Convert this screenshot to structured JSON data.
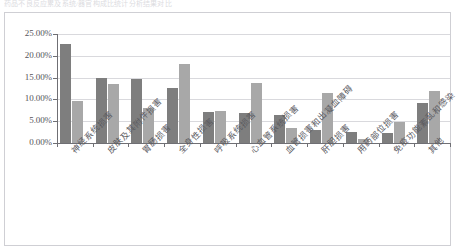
{
  "top_caption": "药品不良反应累及系统/器官构成比统计分析结果对比",
  "chart_data": {
    "type": "bar",
    "title": "",
    "subtitle": "",
    "xlabel": "",
    "ylabel": "",
    "grid": true,
    "legend_position": "none",
    "ylim": [
      0,
      25
    ],
    "ytick_labels": [
      "25.00%",
      "20.00%",
      "15.00%",
      "10.00%",
      "5.00%",
      "0.00%"
    ],
    "ytick_values": [
      25,
      20,
      15,
      10,
      5,
      0
    ],
    "categories": [
      "神经系统损害",
      "皮肤及其附件损害",
      "胃肠损害",
      "全身性损害",
      "呼吸系统损害",
      "心血管系统损害",
      "血管损害和出凝血障碍",
      "肝胆损害",
      "用药部位损害",
      "免疫功能紊乱和感染",
      "其他"
    ],
    "series": [
      {
        "name": "系列1",
        "color": "#7e7e7e",
        "values": [
          22.6,
          14.8,
          14.6,
          12.7,
          7.1,
          6.9,
          6.4,
          2.9,
          2.6,
          2.4,
          9.2
        ]
      },
      {
        "name": "系列2",
        "color": "#a8a8a8",
        "values": [
          9.7,
          13.5,
          8.0,
          18.1,
          7.4,
          13.8,
          3.4,
          11.5,
          1.0,
          4.8,
          11.9
        ]
      }
    ]
  }
}
